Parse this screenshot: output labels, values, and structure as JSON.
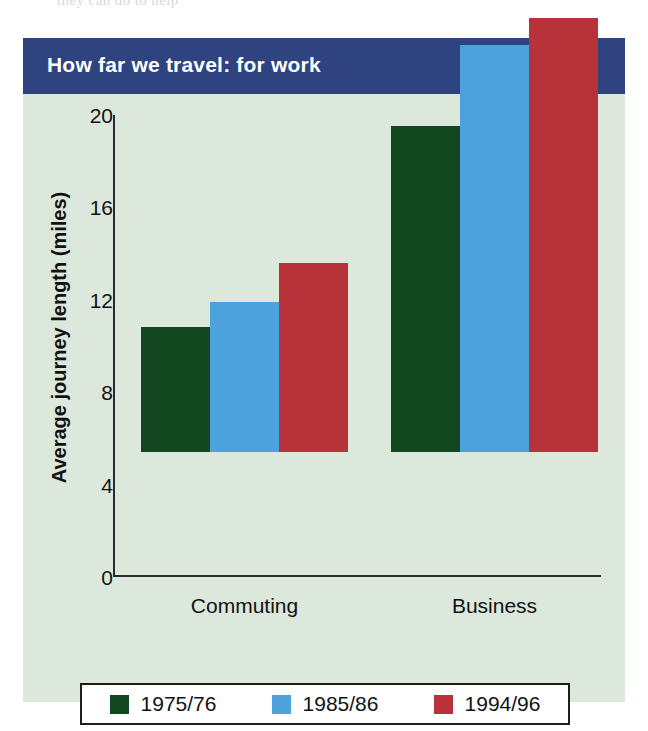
{
  "page_bleed_text": "they can do to help",
  "figure": {
    "title": "How far we travel: for work",
    "title_bg": "#2e4380",
    "panel_bg": "#dde8dd"
  },
  "chart_data": {
    "type": "bar",
    "title": "How far we travel: for work",
    "xlabel": "",
    "ylabel": "Average journey length (miles)",
    "categories": [
      "Commuting",
      "Business"
    ],
    "series": [
      {
        "name": "1975/76",
        "color": "#12471f",
        "values": [
          5.4,
          14.1
        ]
      },
      {
        "name": "1985/86",
        "color": "#4ba2dc",
        "values": [
          6.5,
          17.6
        ]
      },
      {
        "name": "1994/96",
        "color": "#b8323a",
        "values": [
          8.2,
          18.8
        ]
      }
    ],
    "ylim": [
      0,
      20
    ],
    "yticks": [
      0,
      4,
      8,
      12,
      16,
      20
    ],
    "ytick_labels": [
      "0",
      "4",
      "8",
      "12",
      "16",
      "20"
    ],
    "grid": false,
    "legend_position": "bottom"
  }
}
